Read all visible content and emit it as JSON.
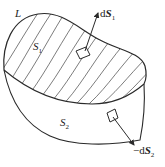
{
  "diagram": {
    "labels": {
      "curve": "L",
      "surface_top": "S",
      "surface_top_sub": "1",
      "surface_bottom": "S",
      "surface_bottom_sub": "2",
      "element_top_prefix": "d",
      "element_top_var": "S",
      "element_top_sub": "1",
      "element_bottom_prefix": "−d",
      "element_bottom_var": "S",
      "element_bottom_sub": "2"
    },
    "colors": {
      "stroke": "#2a2a2a",
      "background": "#ffffff"
    }
  }
}
